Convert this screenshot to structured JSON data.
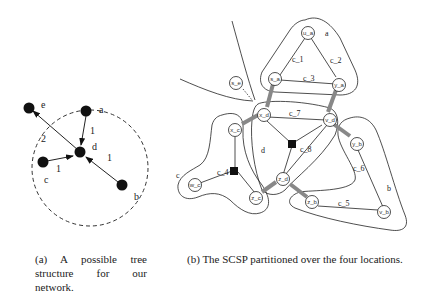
{
  "figure_a": {
    "nodes": [
      {
        "id": "e",
        "label": "e"
      },
      {
        "id": "a",
        "label": "a"
      },
      {
        "id": "d",
        "label": "d"
      },
      {
        "id": "c",
        "label": "c"
      },
      {
        "id": "b",
        "label": "b"
      }
    ],
    "edges": [
      {
        "from": "d",
        "to": "e",
        "weight": "2"
      },
      {
        "from": "a",
        "to": "d",
        "weight": "1"
      },
      {
        "from": "c",
        "to": "d",
        "weight": "1"
      },
      {
        "from": "b",
        "to": "d",
        "weight": "1"
      }
    ],
    "caption": "(a) A possible tree structure for our network."
  },
  "figure_b": {
    "regions": {
      "a": "a",
      "b": "b",
      "c": "c",
      "d": "d"
    },
    "nodes": {
      "u_a": "u_a",
      "s_a": "s_a",
      "y_a": "y_a",
      "x_d": "x_d",
      "v_d": "v_d",
      "z_d": "z_d",
      "x_c": "x_c",
      "w_c": "w_c",
      "z_c": "z_c",
      "y_b": "y_b",
      "z_b": "z_b",
      "v_b": "v_b",
      "s_e": "s_e"
    },
    "constraints": {
      "c_1": "c_1",
      "c_2": "c_2",
      "c_3": "c_3",
      "c_4": "c_4",
      "c_5": "c_5",
      "c_6": "c_6",
      "c_7": "c_7",
      "c_8": "c_8"
    },
    "caption": "(b) The SCSP partitioned over the four locations."
  }
}
